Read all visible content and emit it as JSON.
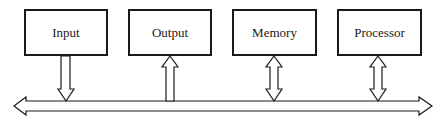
{
  "diagram": {
    "type": "bus-architecture",
    "components": [
      {
        "id": "input",
        "label": "Input",
        "x": 24,
        "y": 9,
        "w": 84,
        "h": 47,
        "connection": "output-to-bus"
      },
      {
        "id": "output",
        "label": "Output",
        "x": 128,
        "y": 9,
        "w": 84,
        "h": 47,
        "connection": "bus-to-component"
      },
      {
        "id": "memory",
        "label": "Memory",
        "x": 232,
        "y": 9,
        "w": 85,
        "h": 47,
        "connection": "bidirectional"
      },
      {
        "id": "processor",
        "label": "Processor",
        "x": 337,
        "y": 9,
        "w": 85,
        "h": 47,
        "connection": "bidirectional"
      }
    ],
    "bus": {
      "label": "",
      "direction": "bidirectional",
      "stroke_color": "#1a1a1a"
    }
  }
}
